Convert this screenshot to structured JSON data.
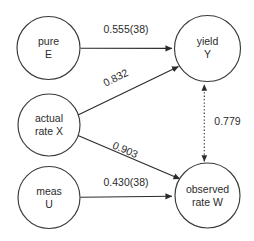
{
  "diagram": {
    "type": "path-diagram",
    "title": "",
    "background_color": "#ffffff",
    "stroke_color": "#2b2b2b",
    "text_color": "#2b2b2b",
    "nodes": [
      {
        "id": "pure-e",
        "line1": "pure",
        "line2": "E",
        "cx": 48.5,
        "cy": 48,
        "r": 31.5
      },
      {
        "id": "actual-rate-x",
        "line1": "actual",
        "line2": "rate X",
        "cx": 49,
        "cy": 125,
        "r": 31
      },
      {
        "id": "meas-u",
        "line1": "meas",
        "line2": "U",
        "cx": 49,
        "cy": 197.5,
        "r": 31
      },
      {
        "id": "yield-y",
        "line1": "yield",
        "line2": "Y",
        "cx": 207.5,
        "cy": 48.5,
        "r": 33
      },
      {
        "id": "observed-rate-w",
        "line1": "observed",
        "line2": "rate W",
        "cx": 207.5,
        "cy": 195.5,
        "r": 32.5
      }
    ],
    "edges": [
      {
        "id": "pure-e-to-yield-y",
        "from": "pure-e",
        "to": "yield-y",
        "label": "0.555(38)",
        "style": "solid",
        "arrows": "single"
      },
      {
        "id": "actual-rate-x-to-yield-y",
        "from": "actual-rate-x",
        "to": "yield-y",
        "label": "0.832",
        "style": "solid",
        "arrows": "single"
      },
      {
        "id": "actual-rate-x-to-observed-rate-w",
        "from": "actual-rate-x",
        "to": "observed-rate-w",
        "label": "0.903",
        "style": "solid",
        "arrows": "single"
      },
      {
        "id": "meas-u-to-observed-rate-w",
        "from": "meas-u",
        "to": "observed-rate-w",
        "label": "0.430(38)",
        "style": "solid",
        "arrows": "single"
      },
      {
        "id": "yield-y-observed-rate-w-correlation",
        "from": "observed-rate-w",
        "to": "yield-y",
        "label": "0.779",
        "style": "dotted",
        "arrows": "double"
      }
    ]
  }
}
